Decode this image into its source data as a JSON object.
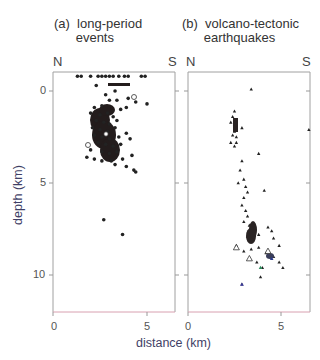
{
  "chart_data": [
    {
      "type": "scatter",
      "panel": "(a)",
      "title": "long-period events",
      "title_lines": [
        "long-period",
        "events"
      ],
      "orientation_labels": {
        "left": "N",
        "right": "S"
      },
      "xlabel": "distance (km)",
      "ylabel": "depth (km)",
      "xlim": [
        0,
        6.5
      ],
      "ylim": [
        12.1,
        -1
      ],
      "x_ticks": [
        0,
        5
      ],
      "y_ticks": [
        0,
        5,
        10
      ],
      "grid": false,
      "marker": "filled-circle",
      "description": "Dense cluster of long-period events between ~2-4 km distance, concentrated at 0.5-3.5 km depth; sparse events near surface (~ -0.8 km) from 1.2-5.5 km; two outliers at ~7 km and ~7.8 km depth.",
      "points": [
        [
          1.3,
          -0.8
        ],
        [
          1.5,
          -0.8
        ],
        [
          2.0,
          -0.8
        ],
        [
          2.4,
          -0.8
        ],
        [
          2.6,
          -0.8
        ],
        [
          2.8,
          -0.8
        ],
        [
          3.0,
          -0.8
        ],
        [
          3.2,
          -0.8
        ],
        [
          3.5,
          -0.8
        ],
        [
          3.8,
          -0.8
        ],
        [
          4.0,
          -0.8
        ],
        [
          4.7,
          -0.8
        ],
        [
          4.9,
          -0.8
        ],
        [
          2.3,
          -0.3
        ],
        [
          2.8,
          0.2
        ],
        [
          3.3,
          0.0
        ],
        [
          3.0,
          0.5
        ],
        [
          3.4,
          0.5
        ],
        [
          4.0,
          0.4
        ],
        [
          4.4,
          0.6
        ],
        [
          5.0,
          0.7
        ],
        [
          2.2,
          0.9
        ],
        [
          2.6,
          0.8
        ],
        [
          3.6,
          1.0
        ],
        [
          3.9,
          0.9
        ],
        [
          2.0,
          1.2
        ],
        [
          2.5,
          1.3
        ],
        [
          2.9,
          1.2
        ],
        [
          3.2,
          1.4
        ],
        [
          2.3,
          1.6
        ],
        [
          2.7,
          1.7
        ],
        [
          3.0,
          1.8
        ],
        [
          3.4,
          1.6
        ],
        [
          2.1,
          2.0
        ],
        [
          2.5,
          2.1
        ],
        [
          2.9,
          2.2
        ],
        [
          3.3,
          2.0
        ],
        [
          2.2,
          2.4
        ],
        [
          2.6,
          2.5
        ],
        [
          3.0,
          2.6
        ],
        [
          3.5,
          2.5
        ],
        [
          3.9,
          2.3
        ],
        [
          4.1,
          2.6
        ],
        [
          2.4,
          2.8
        ],
        [
          2.8,
          2.9
        ],
        [
          3.2,
          3.0
        ],
        [
          3.6,
          2.9
        ],
        [
          2.0,
          3.2
        ],
        [
          2.6,
          3.3
        ],
        [
          3.0,
          3.4
        ],
        [
          3.4,
          3.3
        ],
        [
          1.8,
          3.6
        ],
        [
          2.2,
          3.7
        ],
        [
          2.6,
          3.8
        ],
        [
          3.1,
          3.8
        ],
        [
          3.7,
          3.7
        ],
        [
          4.2,
          3.5
        ],
        [
          3.3,
          4.0
        ],
        [
          3.9,
          4.1
        ],
        [
          4.3,
          4.3
        ],
        [
          4.4,
          4.4
        ],
        [
          2.7,
          7.0
        ],
        [
          3.7,
          7.8
        ]
      ]
    },
    {
      "type": "scatter",
      "panel": "(b)",
      "title": "volcano-tectonic earthquakes",
      "title_lines": [
        "volcano-tectonic",
        "earthquakes"
      ],
      "orientation_labels": {
        "left": "N",
        "right": "S"
      },
      "xlabel": "distance (km)",
      "ylabel": "depth (km)",
      "xlim": [
        0,
        6.5
      ],
      "ylim": [
        12.1,
        -1
      ],
      "x_ticks": [
        0,
        5
      ],
      "y_ticks": [
        0,
        5,
        10
      ],
      "grid": false,
      "marker": "filled-triangle",
      "description": "Volcano-tectonic earthquakes form a narrow band dipping southward: cluster at ~1.5-2.5 km depth near 2.5 km distance, then a trend from ~5 km depth at 3 km distance to ~9 km depth at 4-5 km distance; a few open triangles and colored markers; outliers at (3.4,-0.1), (6.5,2.1), (2.9,10.5).",
      "points": [
        [
          3.4,
          -0.1
        ],
        [
          2.5,
          1.1
        ],
        [
          2.4,
          1.4
        ],
        [
          2.3,
          1.7
        ],
        [
          2.5,
          1.8
        ],
        [
          2.6,
          2.0
        ],
        [
          2.5,
          2.2
        ],
        [
          2.4,
          2.4
        ],
        [
          2.6,
          2.5
        ],
        [
          2.9,
          2.0
        ],
        [
          2.3,
          2.8
        ],
        [
          2.6,
          2.8
        ],
        [
          2.5,
          3.0
        ],
        [
          6.5,
          2.1
        ],
        [
          3.8,
          3.4
        ],
        [
          2.9,
          3.8
        ],
        [
          2.8,
          4.3
        ],
        [
          3.0,
          4.8
        ],
        [
          2.7,
          5.0
        ],
        [
          3.1,
          5.2
        ],
        [
          3.2,
          5.5
        ],
        [
          3.0,
          5.8
        ],
        [
          4.1,
          5.4
        ],
        [
          2.9,
          6.2
        ],
        [
          3.1,
          6.5
        ],
        [
          3.2,
          6.8
        ],
        [
          3.0,
          7.1
        ],
        [
          3.3,
          7.3
        ],
        [
          3.4,
          7.6
        ],
        [
          3.6,
          7.5
        ],
        [
          3.2,
          7.9
        ],
        [
          3.5,
          8.0
        ],
        [
          3.8,
          7.8
        ],
        [
          4.3,
          7.4
        ],
        [
          4.5,
          7.6
        ],
        [
          4.6,
          8.0
        ],
        [
          4.9,
          8.4
        ],
        [
          2.6,
          8.4
        ],
        [
          3.0,
          8.7
        ],
        [
          3.4,
          8.6
        ],
        [
          3.8,
          8.5
        ],
        [
          4.2,
          8.8
        ],
        [
          4.6,
          9.0
        ],
        [
          4.9,
          9.3
        ],
        [
          5.1,
          9.6
        ],
        [
          3.7,
          9.3
        ],
        [
          4.0,
          9.6
        ],
        [
          3.9,
          10.1
        ],
        [
          2.9,
          10.5
        ]
      ],
      "open_markers": [
        [
          2.6,
          8.5
        ],
        [
          3.3,
          9.1
        ],
        [
          4.3,
          8.7
        ]
      ],
      "colored_markers": [
        {
          "x": 3.9,
          "y": 9.6,
          "color": "#2a8a5a"
        },
        {
          "x": 4.5,
          "y": 9.1,
          "color": "#2a3a8a"
        },
        {
          "x": 2.9,
          "y": 10.5,
          "color": "#3a3aa0"
        }
      ]
    }
  ],
  "labels": {
    "panel_a_title": "(a)  long-period\n      events",
    "panel_b_title": "(b)  volcano-tectonic\n      earthquakes",
    "north": "N",
    "south": "S",
    "ylabel": "depth (km)",
    "xlabel": "distance (km)",
    "ytick_0": "0",
    "ytick_5": "5",
    "ytick_10": "10",
    "xtick_0": "0",
    "xtick_5": "5"
  },
  "colors": {
    "frame": "#a0a0a0",
    "bottom_axis": "#d8a0b0",
    "points": "#222222",
    "depth_h_accent": "#b03080"
  }
}
